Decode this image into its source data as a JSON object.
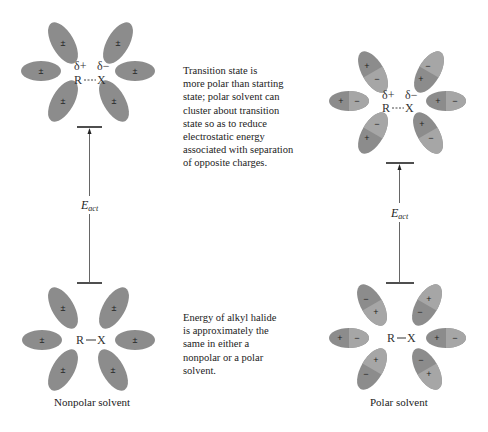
{
  "figure": {
    "panels": [
      {
        "id": "nonpolar",
        "caption": "Nonpolar solvent",
        "transition_state": {
          "delta_plus": "δ+",
          "delta_minus": "δ−",
          "molecule": "R----X",
          "solvent_charge": "±"
        },
        "ground_state": {
          "molecule": "R—X",
          "solvent_charge": "±"
        },
        "energy_label": "E",
        "energy_subscript": "act"
      },
      {
        "id": "polar",
        "caption": "Polar solvent",
        "transition_state": {
          "delta_plus": "δ+",
          "delta_minus": "δ−",
          "molecule": "R----X",
          "plus": "+",
          "minus": "−"
        },
        "ground_state": {
          "molecule": "R—X",
          "plus": "+",
          "minus": "−"
        },
        "energy_label": "E",
        "energy_subscript": "act"
      }
    ],
    "annotations": {
      "transition_state_note": [
        "Transition state is",
        "more polar than starting",
        "state; polar solvent can",
        "cluster about transition",
        "state so as to reduce",
        "electrostatic energy",
        "associated with separation",
        "of opposite charges."
      ],
      "ground_state_note": [
        "Energy of alkyl halide",
        "is approximately the",
        "same in either a",
        "nonpolar or a polar",
        "solvent."
      ]
    },
    "colors": {
      "solvent_fill": "#8c8c8c",
      "solvent_fill_light": "#a6a6a6",
      "line": "#222222"
    }
  }
}
